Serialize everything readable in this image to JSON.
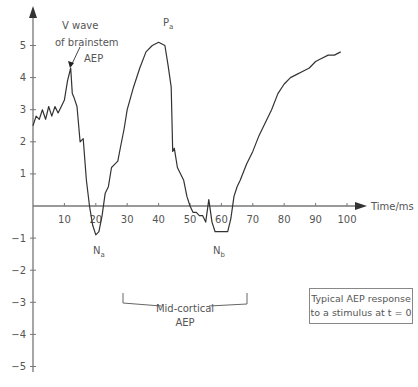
{
  "chart_data": {
    "type": "line",
    "title": "",
    "xlabel": "Time/ms",
    "ylabel": "",
    "xlim": [
      0,
      105
    ],
    "ylim": [
      -5.5,
      5.6
    ],
    "x_ticks": [
      10,
      20,
      30,
      40,
      50,
      60,
      70,
      80,
      90,
      100
    ],
    "y_ticks": [
      5,
      4,
      3,
      2,
      1,
      -1,
      -2,
      -3,
      -4,
      -5
    ],
    "x_tick_labels": [
      "10",
      "20",
      "30",
      "40",
      "50",
      "60",
      "70",
      "80",
      "90",
      "100"
    ],
    "y_tick_labels": [
      "5",
      "4",
      "3",
      "2",
      "1",
      "−1",
      "−2",
      "−3",
      "−4",
      "−5"
    ],
    "grid": false,
    "series": [
      {
        "name": "Typical AEP",
        "x": [
          0,
          1,
          2,
          3,
          4,
          5,
          6,
          7,
          8,
          9,
          10,
          11,
          12,
          12.5,
          13,
          14,
          15,
          16,
          17,
          18,
          19,
          20,
          21,
          22,
          23,
          24,
          25,
          26,
          27,
          28,
          29,
          30,
          32,
          34,
          36,
          38,
          40,
          42,
          43,
          44,
          44.5,
          45,
          46,
          47,
          48,
          49,
          50,
          51,
          52,
          53,
          54,
          55,
          56,
          57,
          58,
          59,
          60,
          61,
          62,
          63,
          64,
          65,
          66,
          68,
          70,
          72,
          74,
          76,
          78,
          80,
          82,
          84,
          86,
          88,
          90,
          92,
          94,
          96,
          98
        ],
        "values": [
          2.5,
          2.8,
          2.7,
          3.0,
          2.7,
          3.1,
          2.8,
          3.1,
          2.9,
          3.1,
          3.3,
          3.9,
          4.3,
          3.5,
          3.4,
          3.1,
          2.0,
          2.1,
          0.8,
          0.0,
          -0.6,
          -0.9,
          -0.8,
          -0.3,
          0.4,
          0.6,
          1.2,
          1.3,
          1.4,
          1.9,
          2.4,
          3.0,
          3.7,
          4.3,
          4.8,
          5.0,
          5.1,
          5.0,
          4.4,
          3.7,
          1.7,
          1.8,
          1.2,
          1.0,
          0.8,
          0.3,
          0.0,
          -0.2,
          -0.2,
          -0.3,
          -0.3,
          -0.5,
          0.2,
          -0.5,
          -0.8,
          -0.8,
          -0.8,
          -0.8,
          -0.8,
          -0.4,
          0.3,
          0.6,
          0.8,
          1.3,
          1.7,
          2.2,
          2.6,
          3.0,
          3.5,
          3.8,
          4.0,
          4.1,
          4.2,
          4.3,
          4.5,
          4.6,
          4.7,
          4.7,
          4.8
        ]
      }
    ],
    "annotations": [
      {
        "text": "V wave of brainstem AEP",
        "x": 12.5,
        "y": 4.3
      },
      {
        "text": "P_a",
        "x": 40,
        "y": 5.1
      },
      {
        "text": "N_a",
        "x": 20,
        "y": -0.9
      },
      {
        "text": "N_b",
        "x": 60,
        "y": -0.8
      },
      {
        "text": "Mid-cortical AEP",
        "x_range": [
          20,
          65
        ],
        "y": -3.0
      }
    ],
    "legend": "Typical AEP response to a stimulus at t = 0"
  },
  "labels": {
    "x_axis": "Time/ms",
    "v_wave_line1": "V wave",
    "v_wave_line2": "of brainstem",
    "v_wave_line3": "AEP",
    "pa_main": "P",
    "pa_sub": "a",
    "na_main": "N",
    "na_sub": "a",
    "nb_main": "N",
    "nb_sub": "b",
    "midcortical_line1": "Mid-cortical",
    "midcortical_line2": "AEP",
    "legend_line1": "Typical AEP response",
    "legend_line2": "to a stimulus at t = 0"
  }
}
